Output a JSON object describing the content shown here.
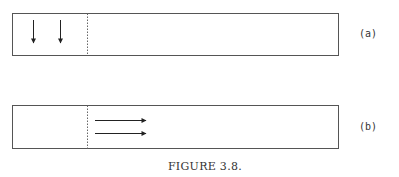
{
  "figure": {
    "caption": "FIGURE 3.8.",
    "colors": {
      "stroke": "#555555",
      "arrow": "#222222",
      "text": "#333333",
      "background": "#ffffff"
    },
    "panels": [
      {
        "id": "a",
        "label": "(a)",
        "box": {
          "x": 12,
          "y": 13,
          "width": 326,
          "height": 42
        },
        "divider_x": 87,
        "divider_style": "dotted",
        "arrows": [
          {
            "direction": "down",
            "x1": 33,
            "y1": 20,
            "x2": 33,
            "y2": 42
          },
          {
            "direction": "down",
            "x1": 60,
            "y1": 20,
            "x2": 60,
            "y2": 42
          }
        ],
        "label_pos": {
          "x": 368,
          "y": 37
        }
      },
      {
        "id": "b",
        "label": "(b)",
        "box": {
          "x": 12,
          "y": 105,
          "width": 326,
          "height": 43
        },
        "divider_x": 87,
        "divider_style": "dotted",
        "arrows": [
          {
            "direction": "right",
            "x1": 95,
            "y1": 120,
            "x2": 145,
            "y2": 120
          },
          {
            "direction": "right",
            "x1": 95,
            "y1": 133,
            "x2": 145,
            "y2": 133
          }
        ],
        "label_pos": {
          "x": 368,
          "y": 130
        }
      }
    ],
    "caption_pos": {
      "x": 205,
      "y": 170
    }
  }
}
